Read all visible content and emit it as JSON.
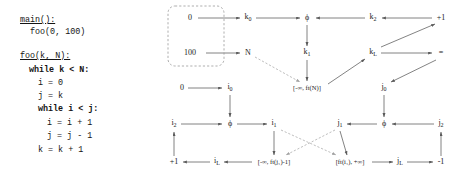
{
  "code": {
    "lines": [
      "main():",
      "  foo(0, 100)",
      "",
      "foo(k, N):",
      "  while k < N:",
      "    i = 0",
      "    j = k",
      "    while i < j:",
      "      i = i + 1",
      "      j = j - 1",
      "    k = k + 1"
    ],
    "signature_main": "main():",
    "call_main": "foo(0, 100)",
    "signature_foo": "foo(k, N):",
    "while_outer": "while k < N:",
    "assign_i0": "i = 0",
    "assign_jk": "j = k",
    "while_inner": "while i < j:",
    "assign_i_inc": "i = i + 1",
    "assign_j_dec": "j = j - 1",
    "assign_k_inc": "k = k + 1",
    "keywords": [
      "while",
      "while"
    ]
  },
  "graph": {
    "title": "",
    "entry_box_label": "",
    "nodes": [
      {
        "id": "const0",
        "label": "0",
        "sub": "",
        "x": 30,
        "y": 18
      },
      {
        "id": "k0",
        "label": "k",
        "sub": "0",
        "x": 88,
        "y": 18
      },
      {
        "id": "phi_k",
        "label": "ϕ",
        "sub": "",
        "x": 147,
        "y": 18
      },
      {
        "id": "k2",
        "label": "k",
        "sub": "2",
        "x": 213,
        "y": 18
      },
      {
        "id": "plus1_k",
        "label": "+1",
        "sub": "",
        "x": 281,
        "y": 18
      },
      {
        "id": "const100",
        "label": "100",
        "sub": "",
        "x": 30,
        "y": 53
      },
      {
        "id": "N",
        "label": "N",
        "sub": "",
        "x": 88,
        "y": 53
      },
      {
        "id": "k1",
        "label": "k",
        "sub": "1",
        "x": 147,
        "y": 53
      },
      {
        "id": "kL",
        "label": "k",
        "sub": "L",
        "x": 213,
        "y": 53
      },
      {
        "id": "eq",
        "label": "=",
        "sub": "",
        "x": 281,
        "y": 53
      },
      {
        "id": "const0b",
        "label": "0",
        "sub": "",
        "x": 22,
        "y": 88
      },
      {
        "id": "i0",
        "label": "i",
        "sub": "0",
        "x": 70,
        "y": 88
      },
      {
        "id": "ivl_N",
        "label": "[-∞, ft(N)]",
        "sub": "",
        "x": 147,
        "y": 88
      },
      {
        "id": "j0",
        "label": "j",
        "sub": "0",
        "x": 224,
        "y": 88
      },
      {
        "id": "i2",
        "label": "i",
        "sub": "2",
        "x": 14,
        "y": 124
      },
      {
        "id": "phi_i",
        "label": "ϕ",
        "sub": "",
        "x": 70,
        "y": 124
      },
      {
        "id": "i1",
        "label": "i",
        "sub": "1",
        "x": 114,
        "y": 124
      },
      {
        "id": "j1",
        "label": "j",
        "sub": "1",
        "x": 180,
        "y": 124
      },
      {
        "id": "phi_j",
        "label": "ϕ",
        "sub": "",
        "x": 224,
        "y": 124
      },
      {
        "id": "j2",
        "label": "j",
        "sub": "2",
        "x": 281,
        "y": 124
      },
      {
        "id": "plus1_i",
        "label": "+1",
        "sub": "",
        "x": 14,
        "y": 162
      },
      {
        "id": "iL",
        "label": "i",
        "sub": "L",
        "x": 57,
        "y": 162
      },
      {
        "id": "ivl_j1",
        "label": "[-∞, ft(j₁)-1]",
        "sub": "",
        "x": 114,
        "y": 162
      },
      {
        "id": "ivl_i1",
        "label": "[ft(i₁), +∞]",
        "sub": "",
        "x": 190,
        "y": 162
      },
      {
        "id": "jL",
        "label": "j",
        "sub": "L",
        "x": 240,
        "y": 162
      },
      {
        "id": "minus1",
        "label": "-1",
        "sub": "",
        "x": 281,
        "y": 162
      }
    ],
    "edges": [
      {
        "from": "const0",
        "to": "k0",
        "style": "solid"
      },
      {
        "from": "k0",
        "to": "phi_k",
        "style": "solid"
      },
      {
        "from": "k2",
        "to": "phi_k",
        "style": "solid"
      },
      {
        "from": "plus1_k",
        "to": "k2",
        "style": "solid"
      },
      {
        "from": "phi_k",
        "to": "k1",
        "style": "solid"
      },
      {
        "from": "const100",
        "to": "N",
        "style": "solid"
      },
      {
        "from": "N",
        "to": "ivl_N",
        "style": "dashed"
      },
      {
        "from": "k1",
        "to": "ivl_N",
        "style": "solid"
      },
      {
        "from": "ivl_N",
        "to": "kL",
        "style": "solid"
      },
      {
        "from": "kL",
        "to": "eq",
        "style": "solid"
      },
      {
        "from": "kL",
        "to": "plus1_k",
        "style": "solid"
      },
      {
        "from": "eq",
        "to": "j0",
        "style": "solid"
      },
      {
        "from": "const0b",
        "to": "i0",
        "style": "solid"
      },
      {
        "from": "i0",
        "to": "phi_i",
        "style": "solid"
      },
      {
        "from": "i2",
        "to": "phi_i",
        "style": "solid"
      },
      {
        "from": "phi_i",
        "to": "i1",
        "style": "solid"
      },
      {
        "from": "j0",
        "to": "phi_j",
        "style": "solid"
      },
      {
        "from": "j2",
        "to": "phi_j",
        "style": "solid"
      },
      {
        "from": "phi_j",
        "to": "j1",
        "style": "solid"
      },
      {
        "from": "i1",
        "to": "ivl_j1",
        "style": "solid"
      },
      {
        "from": "j1",
        "to": "ivl_i1",
        "style": "solid"
      },
      {
        "from": "i1",
        "to": "ivl_i1",
        "style": "dashed"
      },
      {
        "from": "j1",
        "to": "ivl_j1",
        "style": "dashed"
      },
      {
        "from": "ivl_j1",
        "to": "iL",
        "style": "solid"
      },
      {
        "from": "iL",
        "to": "plus1_i",
        "style": "solid"
      },
      {
        "from": "plus1_i",
        "to": "i2",
        "style": "solid"
      },
      {
        "from": "ivl_i1",
        "to": "jL",
        "style": "solid"
      },
      {
        "from": "jL",
        "to": "minus1",
        "style": "solid"
      },
      {
        "from": "minus1",
        "to": "j2",
        "style": "solid"
      }
    ],
    "entry_box": {
      "x": 8,
      "y": 6,
      "w": 56,
      "h": 60,
      "style": "dashed-rounded"
    }
  },
  "colors": {
    "ink": "#1a1a1a",
    "edge": "#5a5a5a",
    "dashed_edge": "#9a9a9a",
    "background": "#ffffff"
  }
}
